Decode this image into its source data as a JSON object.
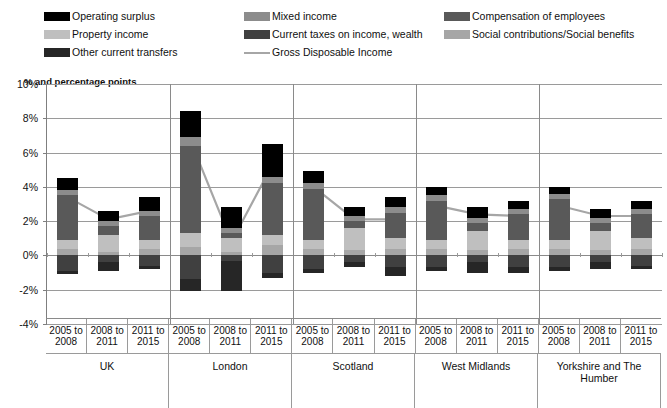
{
  "legend": {
    "columns": [
      [
        {
          "label": "Operating surplus",
          "color": "#000000",
          "kind": "swatch",
          "icon": "legend-swatch"
        },
        {
          "label": "Property income",
          "color": "#bfbfbf",
          "kind": "swatch",
          "icon": "legend-swatch"
        },
        {
          "label": "Other current transfers",
          "color": "#262626",
          "kind": "swatch",
          "icon": "legend-swatch"
        }
      ],
      [
        {
          "label": "Mixed income",
          "color": "#8c8c8c",
          "kind": "swatch",
          "icon": "legend-swatch"
        },
        {
          "label": "Current taxes on income, wealth",
          "color": "#404040",
          "kind": "swatch",
          "icon": "legend-swatch"
        },
        {
          "label": "Gross Disposable Income",
          "color": "#a6a6a6",
          "kind": "line",
          "icon": "legend-line"
        }
      ],
      [
        {
          "label": "Compensation of employees",
          "color": "#595959",
          "kind": "swatch",
          "icon": "legend-swatch"
        },
        {
          "label": "Social contributions/Social benefits",
          "color": "#a6a6a6",
          "kind": "swatch",
          "icon": "legend-swatch"
        }
      ]
    ]
  },
  "axis_title": "% and percentage points",
  "chart_data": {
    "type": "bar",
    "subtype": "stacked-bar-with-line",
    "title": "",
    "subtitle": "",
    "xlabel": "",
    "ylabel": "% and percentage points",
    "ylim": [
      -4,
      10
    ],
    "yticks": [
      "-4%",
      "-2%",
      "0%",
      "2%",
      "4%",
      "6%",
      "8%",
      "10%"
    ],
    "ytick_values": [
      -4,
      -2,
      0,
      2,
      4,
      6,
      8,
      10
    ],
    "grid": true,
    "legend_position": "top",
    "groups": [
      "UK",
      "London",
      "Scotland",
      "West Midlands",
      "Yorkshire and The Humber"
    ],
    "categories": [
      "2005 to 2008",
      "2008 to 2011",
      "2011 to 2015",
      "2005 to 2008",
      "2008 to 2011",
      "2011 to 2015",
      "2005 to 2008",
      "2008 to 2011",
      "2011 to 2015",
      "2005 to 2008",
      "2008 to 2011",
      "2011 to 2015",
      "2005 to 2008",
      "2008 to 2011",
      "2011 to 2015"
    ],
    "series": [
      {
        "name": "Operating surplus",
        "color": "#000000",
        "values": [
          0.7,
          0.6,
          0.8,
          1.5,
          1.2,
          1.9,
          0.7,
          0.5,
          0.6,
          0.5,
          0.6,
          0.5,
          0.4,
          0.5,
          0.5
        ]
      },
      {
        "name": "Mixed income",
        "color": "#8c8c8c",
        "values": [
          0.3,
          0.3,
          0.3,
          0.5,
          0.3,
          0.4,
          0.3,
          0.3,
          0.3,
          0.3,
          0.3,
          0.3,
          0.3,
          0.3,
          0.3
        ]
      },
      {
        "name": "Compensation of employees",
        "color": "#595959",
        "values": [
          2.6,
          0.5,
          1.4,
          5.1,
          0.3,
          3.0,
          3.0,
          0.4,
          1.5,
          2.3,
          0.5,
          1.5,
          2.4,
          0.5,
          1.4
        ]
      },
      {
        "name": "Property income",
        "color": "#bfbfbf",
        "values": [
          0.5,
          1.0,
          0.5,
          0.8,
          0.8,
          0.6,
          0.5,
          1.3,
          0.6,
          0.5,
          1.1,
          0.5,
          0.5,
          1.1,
          0.6
        ]
      },
      {
        "name": "Current taxes on income, wealth",
        "color": "#404040",
        "values": [
          -0.9,
          -0.4,
          -0.6,
          -1.4,
          -0.3,
          -1.0,
          -0.8,
          -0.4,
          -0.7,
          -0.7,
          -0.4,
          -0.7,
          -0.7,
          -0.4,
          -0.6
        ]
      },
      {
        "name": "Social contributions/Social benefits",
        "color": "#a6a6a6",
        "values": [
          0.4,
          0.2,
          0.4,
          0.5,
          0.2,
          0.6,
          0.4,
          0.3,
          0.4,
          0.4,
          0.3,
          0.4,
          0.4,
          0.3,
          0.4
        ]
      },
      {
        "name": "Other current transfers",
        "color": "#262626",
        "values": [
          -0.2,
          -0.5,
          -0.2,
          -0.7,
          -1.8,
          -0.3,
          -0.2,
          -0.3,
          -0.5,
          -0.2,
          -0.6,
          -0.3,
          -0.2,
          -0.4,
          -0.2
        ]
      }
    ],
    "line_series": {
      "name": "Gross Disposable Income",
      "color": "#a6a6a6",
      "values": [
        3.4,
        2.1,
        2.6,
        6.7,
        0.8,
        5.3,
        4.0,
        2.1,
        2.1,
        2.9,
        2.4,
        2.3,
        2.9,
        2.3,
        2.3
      ]
    },
    "bar_extents": [
      {
        "top": 4.4,
        "bottom": -1.1
      },
      {
        "top": 2.5,
        "bottom": -0.9
      },
      {
        "top": 3.2,
        "bottom": -0.8
      },
      {
        "top": 8.9,
        "bottom": -2.1
      },
      {
        "top": 2.7,
        "bottom": -2.1
      },
      {
        "top": 6.4,
        "bottom": -1.3
      },
      {
        "top": 5.9,
        "bottom": -1.0
      },
      {
        "top": 2.7,
        "bottom": -0.7
      },
      {
        "top": 3.0,
        "bottom": -1.2
      },
      {
        "top": 3.6,
        "bottom": -0.9
      },
      {
        "top": 2.6,
        "bottom": -1.0
      },
      {
        "top": 3.1,
        "bottom": -1.0
      },
      {
        "top": 3.8,
        "bottom": -0.9
      },
      {
        "top": 2.8,
        "bottom": -0.8
      },
      {
        "top": 2.8,
        "bottom": -0.8
      }
    ]
  }
}
